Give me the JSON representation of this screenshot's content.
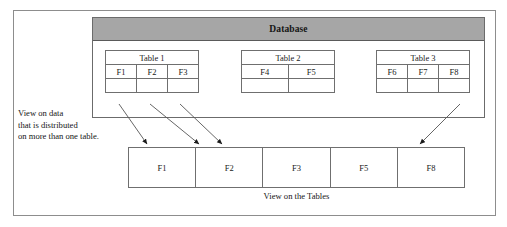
{
  "diagram": {
    "title": "Database",
    "outer_frame": {
      "name": "diagram-border"
    },
    "tables": [
      {
        "title": "Table 1",
        "fields": [
          "F1",
          "F2",
          "F3"
        ]
      },
      {
        "title": "Table 2",
        "fields": [
          "F4",
          "F5"
        ]
      },
      {
        "title": "Table 3",
        "fields": [
          "F6",
          "F7",
          "F8"
        ]
      }
    ],
    "left_caption": {
      "line1": "View on data",
      "line2": "that is distributed",
      "line3": "on more than one table."
    },
    "view": {
      "cells": [
        "F1",
        "F2",
        "F3",
        "F5",
        "F8"
      ],
      "caption": "View on the Tables"
    },
    "arrows": [
      {
        "from": "Table 1.F1",
        "to": "View.F1"
      },
      {
        "from": "Table 1.F2",
        "to": "View.F2"
      },
      {
        "from": "Table 1.F3",
        "to": "View.F2"
      },
      {
        "from": "Table 3.F8",
        "to": "View.F8"
      }
    ],
    "colors": {
      "header_fill": "#a6a6a6",
      "line": "#6f6f6f",
      "frame": "#8d8d8d",
      "text": "#151515",
      "background": "#ffffff"
    }
  }
}
